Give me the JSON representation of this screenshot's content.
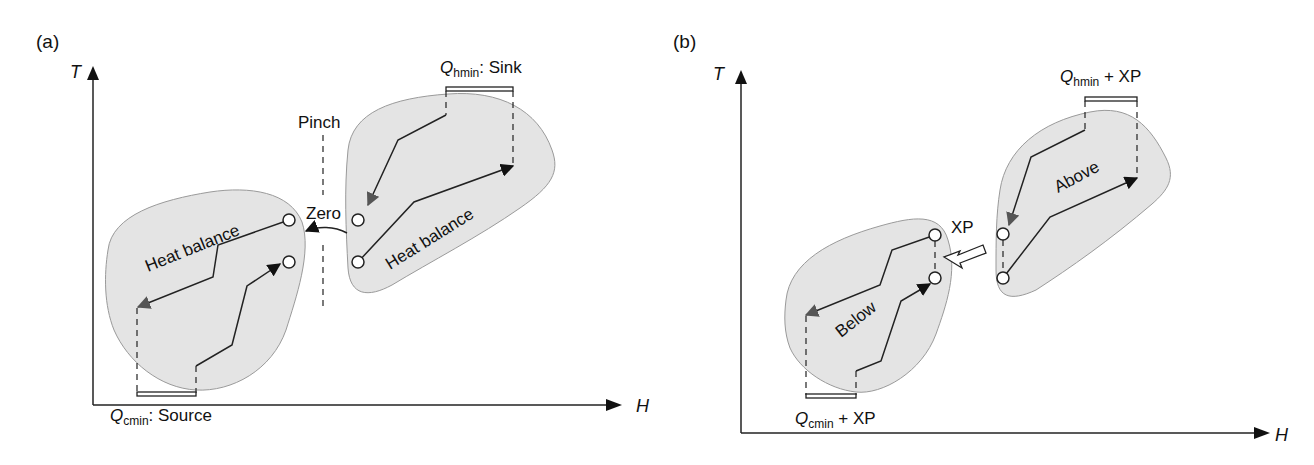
{
  "panels": {
    "a": {
      "tag": "(a)",
      "y_axis": "T",
      "x_axis": "H",
      "pinch_label": "Pinch",
      "zero_label": "Zero",
      "left_region_label": "Heat balance",
      "right_region_label": "Heat balance",
      "hot_utility": {
        "symbol": "Q",
        "subscript": "hmin",
        "suffix": ": Sink"
      },
      "cold_utility": {
        "symbol": "Q",
        "subscript": "cmin",
        "suffix": ": Source"
      }
    },
    "b": {
      "tag": "(b)",
      "y_axis": "T",
      "x_axis": "H",
      "xp_label": "XP",
      "below_label": "Below",
      "above_label": "Above",
      "hot_utility": {
        "symbol": "Q",
        "subscript": "hmin",
        "suffix": " + XP"
      },
      "cold_utility": {
        "symbol": "Q",
        "subscript": "cmin",
        "suffix": " + XP"
      }
    }
  },
  "colors": {
    "region_fill": "#e4e4e4",
    "region_stroke": "#9a9a9a",
    "line": "#222222"
  }
}
